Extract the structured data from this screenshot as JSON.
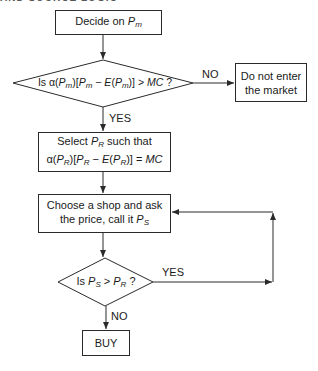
{
  "flowchart": {
    "start_box": {
      "text": "Decide on ",
      "var": "P",
      "sub": "m"
    },
    "decision1": {
      "text": "Is α(P_m)[P_m − E(P_m)] > MC ?",
      "no_label": "NO",
      "yes_label": "YES"
    },
    "exit_box": {
      "line1": "Do not enter",
      "line2": "the market"
    },
    "select_box": {
      "line1_prefix": "Select ",
      "line1_var": "P",
      "line1_sub": "R",
      "line1_suffix": " such that",
      "line2": "α(P_R)[P_R − E(P_R)] = MC"
    },
    "shop_box": {
      "line1": "Choose a shop and ask",
      "line2_prefix": "the price, call it ",
      "line2_var": "P",
      "line2_sub": "S"
    },
    "decision2": {
      "text": "Is P_S > P_R ?",
      "yes_label": "YES",
      "no_label": "NO"
    },
    "end_box": {
      "text": "BUY"
    }
  },
  "colors": {
    "line": "#2a2a2a",
    "background": "#ffffff",
    "text": "#1a1a1a"
  }
}
